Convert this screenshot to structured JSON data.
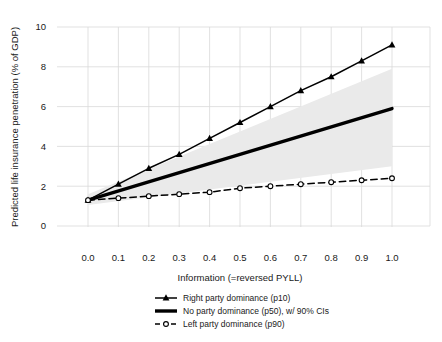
{
  "figure": {
    "background": "#ffffff",
    "line_color": "#000000",
    "grid_color": "#d9d9d9",
    "ci_band_color": "#eaeaea",
    "text_color": "#1a1a1a"
  },
  "chart_data": {
    "type": "line",
    "title": "",
    "xlabel": "Information (=reversed PYLL)",
    "ylabel": "Predicted life insurance penetration (% of GDP)",
    "xlim": [
      0.0,
      1.0
    ],
    "ylim": [
      0,
      10
    ],
    "grid": true,
    "legend_position": "below",
    "x_ticks": [
      {
        "label": "0.0",
        "value": 0.0
      },
      {
        "label": "0.1",
        "value": 0.1
      },
      {
        "label": "0.2",
        "value": 0.2
      },
      {
        "label": "0.3",
        "value": 0.3
      },
      {
        "label": "0.4",
        "value": 0.4
      },
      {
        "label": "0.5",
        "value": 0.5
      },
      {
        "label": "0.6",
        "value": 0.6
      },
      {
        "label": "0.7",
        "value": 0.7
      },
      {
        "label": "0.8",
        "value": 0.8
      },
      {
        "label": "0.9",
        "value": 0.9
      },
      {
        "label": "1.0",
        "value": 1.0
      }
    ],
    "y_ticks": [
      {
        "label": "0",
        "value": 0
      },
      {
        "label": "2",
        "value": 2
      },
      {
        "label": "4",
        "value": 4
      },
      {
        "label": "6",
        "value": 6
      },
      {
        "label": "8",
        "value": 8
      },
      {
        "label": "10",
        "value": 10
      }
    ],
    "ci_band": {
      "x": [
        0.0,
        1.0
      ],
      "upper": [
        1.6,
        7.9
      ],
      "lower": [
        1.05,
        3.0
      ]
    },
    "series": [
      {
        "name": "Right party dominance (p10)",
        "line": "solid",
        "width": 1.5,
        "marker": "triangle",
        "x": [
          0.0,
          0.1,
          0.2,
          0.3,
          0.4,
          0.5,
          0.6,
          0.7,
          0.8,
          0.9,
          1.0
        ],
        "y": [
          1.3,
          2.1,
          2.9,
          3.6,
          4.4,
          5.2,
          6.0,
          6.8,
          7.5,
          8.3,
          9.1
        ]
      },
      {
        "name": "No party dominance (p50), w/ 90% CIs",
        "line": "solid",
        "width": 3.4,
        "marker": "none",
        "x": [
          0.0,
          1.0
        ],
        "y": [
          1.3,
          5.9
        ]
      },
      {
        "name": "Left party dominance (p90)",
        "line": "dashed",
        "width": 1.5,
        "marker": "circle-open",
        "x": [
          0.0,
          0.1,
          0.2,
          0.3,
          0.4,
          0.5,
          0.6,
          0.7,
          0.8,
          0.9,
          1.0
        ],
        "y": [
          1.3,
          1.4,
          1.5,
          1.6,
          1.7,
          1.9,
          2.0,
          2.1,
          2.2,
          2.3,
          2.4
        ]
      }
    ]
  }
}
